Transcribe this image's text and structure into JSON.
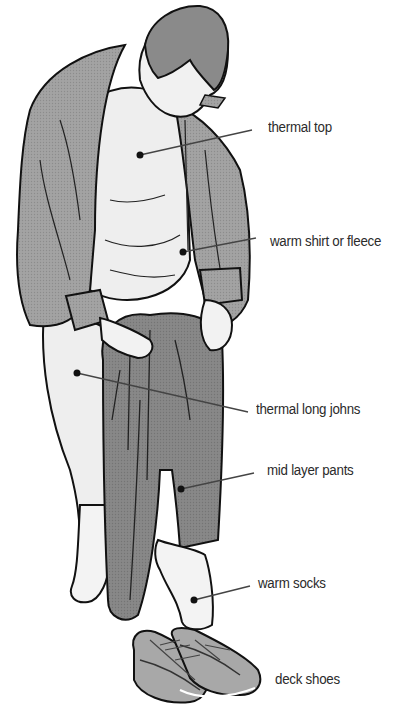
{
  "diagram": {
    "colors": {
      "outline": "#111111",
      "shirt": "#9a9a9a",
      "thermal": "#ececec",
      "pants": "#7f7f7f",
      "hair": "#8a8a8a",
      "sock": "#f2f2f2",
      "shoe_dark": "#6e6e6e",
      "shoe_light": "#a8a8a8",
      "label_text": "#2b2b2b",
      "leader_line": "#444444"
    },
    "labels": [
      {
        "id": "thermal-top",
        "text": "thermal top",
        "x": 268,
        "y": 118,
        "point": [
          140,
          155
        ]
      },
      {
        "id": "warm-shirt",
        "text": "warm shirt or fleece",
        "x": 270,
        "y": 233,
        "point": [
          183,
          252
        ]
      },
      {
        "id": "thermal-long-johns",
        "text": "thermal long johns",
        "x": 256,
        "y": 400,
        "point": [
          77,
          373
        ]
      },
      {
        "id": "mid-layer-pants",
        "text": "mid layer pants",
        "x": 267,
        "y": 461,
        "point": [
          181,
          489
        ]
      },
      {
        "id": "warm-socks",
        "text": "warm socks",
        "x": 258,
        "y": 575,
        "point": [
          194,
          600
        ]
      },
      {
        "id": "deck-shoes",
        "text": "deck shoes",
        "x": 275,
        "y": 670,
        "point": null
      }
    ]
  }
}
